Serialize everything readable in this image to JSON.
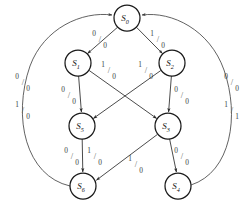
{
  "diagram": {
    "kind": "state-transition-diagram",
    "title": "",
    "stroke_color": "#2b2b2b",
    "node_fill": "#ffffff",
    "label_color": "#3d3d3d",
    "nodes": [
      {
        "id": "S0",
        "label": "S",
        "sub": "0",
        "cx": 127,
        "cy": 18,
        "r": 13
      },
      {
        "id": "S1",
        "label": "S",
        "sub": "1",
        "cx": 78,
        "cy": 63,
        "r": 13
      },
      {
        "id": "S2",
        "label": "S",
        "sub": "2",
        "cx": 172,
        "cy": 63,
        "r": 13
      },
      {
        "id": "S5",
        "label": "S",
        "sub": "5",
        "cx": 82,
        "cy": 126,
        "r": 13
      },
      {
        "id": "S3",
        "label": "S",
        "sub": "3",
        "cx": 168,
        "cy": 126,
        "r": 13
      },
      {
        "id": "S6",
        "label": "S",
        "sub": "6",
        "cx": 83,
        "cy": 186,
        "r": 13
      },
      {
        "id": "S4",
        "label": "S",
        "sub": "4",
        "cx": 178,
        "cy": 186,
        "r": 13
      }
    ],
    "edges": [
      {
        "id": "e-s0-s1",
        "from": "S0",
        "to": "S1",
        "input": "0",
        "output": "0",
        "label_x": 97,
        "label_y": 39
      },
      {
        "id": "e-s0-s2",
        "from": "S0",
        "to": "S2",
        "input": "1",
        "output": "0",
        "label_x": 155,
        "label_y": 39
      },
      {
        "id": "e-s1-s5",
        "from": "S1",
        "to": "S5",
        "input": "0",
        "output": "0",
        "label_x": 68,
        "label_y": 95
      },
      {
        "id": "e-s1-s3",
        "from": "S1",
        "to": "S3",
        "input": "1",
        "output": "0",
        "label_x": 106,
        "label_y": 70
      },
      {
        "id": "e-s2-s5",
        "from": "S2",
        "to": "S5",
        "input": "1",
        "output": "0",
        "label_x": 143,
        "label_y": 70
      },
      {
        "id": "e-s2-s3",
        "from": "S2",
        "to": "S3",
        "input": "0",
        "output": "0",
        "label_x": 181,
        "label_y": 95
      },
      {
        "id": "e-s5-s6-a",
        "from": "S5",
        "to": "S6",
        "input": "0",
        "output": "0",
        "label_x": 71,
        "label_y": 156
      },
      {
        "id": "e-s5-s6-b",
        "from": "S5",
        "to": "S6",
        "input": "1",
        "output": "0",
        "label_x": 92,
        "label_y": 156
      },
      {
        "id": "e-s3-s6",
        "from": "S3",
        "to": "S6",
        "input": "1",
        "output": "0",
        "label_x": 133,
        "label_y": 164
      },
      {
        "id": "e-s3-s4",
        "from": "S3",
        "to": "S4",
        "input": "0",
        "output": "0",
        "label_x": 180,
        "label_y": 156
      }
    ],
    "return_arcs": [
      {
        "id": "arc-s6-s0",
        "from": "S6",
        "to": "S0",
        "side": "left",
        "labels": [
          {
            "input": "0",
            "output": "0",
            "label_x": 22,
            "label_y": 82
          },
          {
            "input": "1",
            "output": "0",
            "label_x": 22,
            "label_y": 110
          }
        ]
      },
      {
        "id": "arc-s4-s0",
        "from": "S4",
        "to": "S0",
        "side": "right",
        "labels": [
          {
            "input": "0",
            "output": "0",
            "label_x": 231,
            "label_y": 82
          },
          {
            "input": "1",
            "output": "1",
            "label_x": 231,
            "label_y": 110
          }
        ]
      }
    ]
  }
}
